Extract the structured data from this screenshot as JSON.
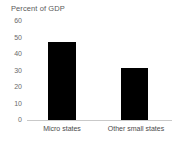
{
  "chart_data": {
    "type": "bar",
    "title": "Percent of GDP",
    "xlabel": "",
    "ylabel": "",
    "categories": [
      "Micro states",
      "Other small states"
    ],
    "values": [
      47,
      31.5
    ],
    "yticks": [
      0,
      10,
      20,
      30,
      40,
      50,
      60
    ],
    "ytick_labels": [
      "0",
      "10",
      "20",
      "30",
      "40",
      "50",
      "60"
    ],
    "ylim": [
      0,
      60
    ],
    "grid": false,
    "legend": false,
    "bar_color": "#000000",
    "axis_color": "#c9c9c9",
    "text_color": "#5a5a5a",
    "background": "#ffffff"
  },
  "axis": {
    "tick_60": "60",
    "tick_50": "50",
    "tick_40": "40",
    "tick_30": "30",
    "tick_20": "20",
    "tick_10": "10",
    "tick_0": "0"
  },
  "labels": {
    "cat_0": "Micro states",
    "cat_1": "Other small states"
  }
}
